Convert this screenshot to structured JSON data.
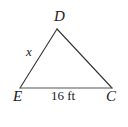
{
  "figure": {
    "type": "geometry-diagram",
    "shape": "triangle",
    "background_color": "#ffffff",
    "stroke_color": "#333333",
    "text_color": "#1a1a1a",
    "stroke_width": 1.1,
    "canvas": {
      "width": 128,
      "height": 127
    },
    "vertices": [
      {
        "id": "D",
        "label": "D",
        "x": 57,
        "y": 29,
        "role": "apex"
      },
      {
        "id": "E",
        "label": "E",
        "x": 20,
        "y": 88,
        "role": "bottom-left"
      },
      {
        "id": "C",
        "label": "C",
        "x": 112,
        "y": 88,
        "role": "bottom-right"
      }
    ],
    "sides": [
      {
        "id": "ED",
        "from": "E",
        "to": "D",
        "label": "x",
        "label_style": "italic",
        "known": false
      },
      {
        "id": "DC",
        "from": "D",
        "to": "C",
        "label": "",
        "label_style": "italic",
        "known": false
      },
      {
        "id": "EC",
        "from": "E",
        "to": "C",
        "label": "16 ft",
        "label_style": "upright",
        "known": true
      }
    ],
    "labels": {
      "apex": "D",
      "left_vertex": "E",
      "right_vertex": "C",
      "unknown_side": "x",
      "base_measure": "16 ft"
    }
  }
}
